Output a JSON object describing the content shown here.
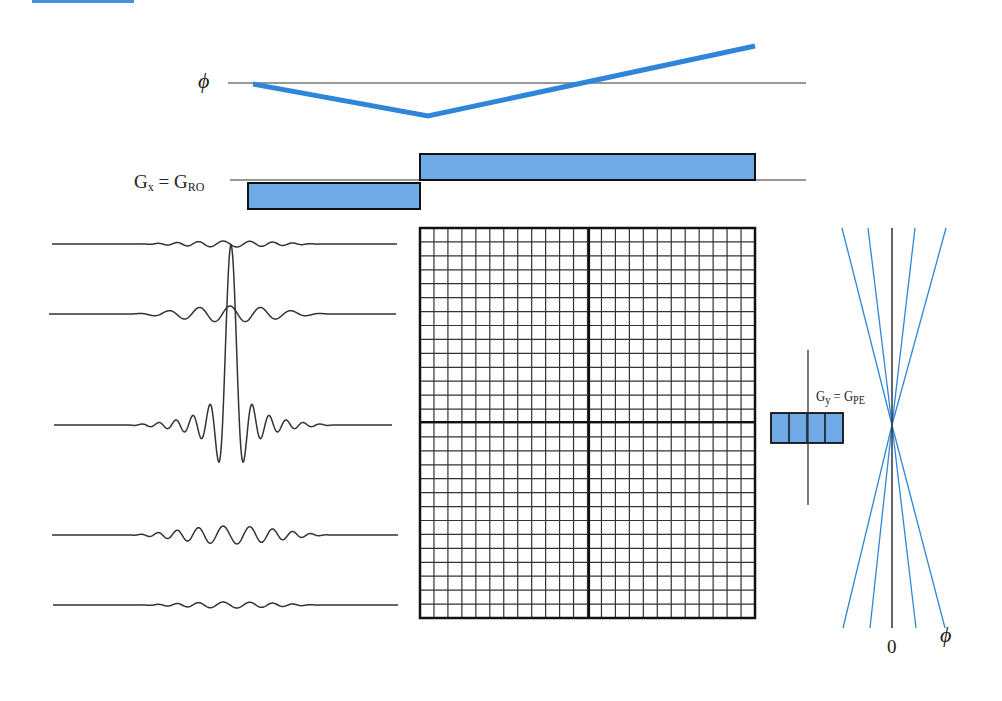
{
  "figure": {
    "top_bar_color": "#4a8fdc",
    "accent_color": "#2f86d8",
    "fill_color": "#6fa9e6",
    "line_color": "#222222"
  },
  "labels": {
    "phi_top": "ϕ",
    "gx_main": "G",
    "gx_sub": "x",
    "gx_eq": " = G",
    "gx_ro": "RO",
    "gy_main": "G",
    "gy_sub": "y",
    "gy_eq": " = G",
    "gy_pe": "PE",
    "zero": "0",
    "phi_right": "ϕ"
  },
  "phase_plot": {
    "baseline_y": 83,
    "baseline_x": [
      228,
      806
    ],
    "points": [
      [
        253,
        84
      ],
      [
        428,
        116
      ],
      [
        755,
        46
      ]
    ]
  },
  "readout_gradient": {
    "baseline_y": 180,
    "baseline_x": [
      230,
      806
    ],
    "lobes": [
      {
        "x0": 248,
        "x1": 420,
        "y0": 183,
        "y1": 209,
        "polarity": "negative"
      },
      {
        "x0": 420,
        "x1": 755,
        "y0": 154,
        "y1": 180,
        "polarity": "positive"
      }
    ]
  },
  "echo_signals": [
    {
      "y": 244,
      "x0": 52,
      "x1": 397,
      "amp": 3,
      "center": 230,
      "span": 190,
      "peak": 0
    },
    {
      "y": 314,
      "x0": 49,
      "x1": 396,
      "amp": 8,
      "center": 230,
      "span": 200,
      "peak": 0,
      "dip": true
    },
    {
      "y": 425,
      "x0": 54,
      "x1": 392,
      "amp": 40,
      "center": 231,
      "span": 210,
      "peak": 1
    },
    {
      "y": 535,
      "x0": 52,
      "x1": 398,
      "amp": 9,
      "center": 230,
      "span": 200,
      "peak": 0
    },
    {
      "y": 605,
      "x0": 53,
      "x1": 398,
      "amp": 3,
      "center": 230,
      "span": 190,
      "peak": 0
    }
  ],
  "kspace_grid": {
    "x0": 420,
    "y0": 228,
    "x1": 755,
    "y1": 618,
    "cols": 24,
    "rows": 28,
    "center_x": 589,
    "center_y": 422
  },
  "phase_encode_gradient": {
    "axis_x": 808,
    "axis_y0": 350,
    "axis_y1": 505,
    "box": {
      "x0": 771,
      "x1": 843,
      "y0": 413,
      "y1": 443
    },
    "steps": 4
  },
  "phase_fan": {
    "center": [
      892,
      425
    ],
    "axis_y0": 228,
    "axis_y1": 628,
    "top_x": [
      842,
      868,
      915,
      946
    ],
    "bottom_x": [
      843,
      870,
      916,
      945
    ]
  }
}
